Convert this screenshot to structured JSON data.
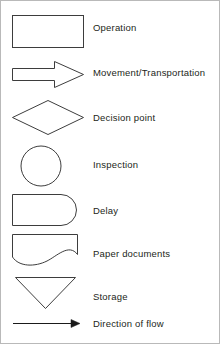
{
  "legend": {
    "title": "Flowchart symbols legend",
    "stroke_color": "#3d3d3d",
    "text_color": "#231f20",
    "background_color": "#ffffff",
    "border_color": "#b9b9b9",
    "rows": [
      {
        "id": "operation",
        "shape": "rectangle",
        "shape_icon": "rectangle-shape-icon",
        "label": "Operation"
      },
      {
        "id": "movement",
        "shape": "right-arrow",
        "shape_icon": "right-arrow-shape-icon",
        "label": "Movement/Transportation"
      },
      {
        "id": "decision",
        "shape": "diamond",
        "shape_icon": "diamond-shape-icon",
        "label": "Decision point"
      },
      {
        "id": "inspection",
        "shape": "circle",
        "shape_icon": "circle-shape-icon",
        "label": "Inspection"
      },
      {
        "id": "delay",
        "shape": "half-rounded-rectangle",
        "shape_icon": "delay-shape-icon",
        "label": "Delay"
      },
      {
        "id": "paper",
        "shape": "wavy-bottom-rectangle",
        "shape_icon": "document-shape-icon",
        "label": "Paper documents"
      },
      {
        "id": "storage",
        "shape": "inverted-triangle",
        "shape_icon": "inverted-triangle-shape-icon",
        "label": "Storage"
      },
      {
        "id": "flow",
        "shape": "arrow-line",
        "shape_icon": "flow-arrow-icon",
        "label": "Direction of flow"
      }
    ]
  }
}
